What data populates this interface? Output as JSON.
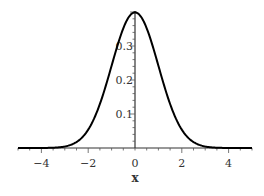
{
  "chart_data": {
    "type": "line",
    "title": "",
    "xlabel": "x",
    "ylabel": "",
    "xlim": [
      -5,
      5
    ],
    "ylim": [
      0,
      0.4
    ],
    "grid": false,
    "legend": null,
    "x_ticks": [
      -4,
      -2,
      0,
      2,
      4
    ],
    "x_tick_labels": [
      "−4",
      "−2",
      "0",
      "2",
      "4"
    ],
    "y_ticks": [
      0.1,
      0.2,
      0.3
    ],
    "y_tick_labels": [
      "0.1",
      "0.2",
      "0.3"
    ],
    "series": [
      {
        "name": "standard normal pdf",
        "function": "exp(-x^2/2)/sqrt(2*pi)",
        "x": [
          -5,
          -4,
          -3,
          -2.5,
          -2,
          -1.5,
          -1,
          -0.5,
          0,
          0.5,
          1,
          1.5,
          2,
          2.5,
          3,
          4,
          5
        ],
        "values": [
          1.5e-06,
          0.000134,
          0.00443,
          0.0175,
          0.054,
          0.1295,
          0.242,
          0.352,
          0.399,
          0.352,
          0.242,
          0.1295,
          0.054,
          0.0175,
          0.00443,
          0.000134,
          1.5e-06
        ],
        "color": "#000000"
      }
    ]
  }
}
